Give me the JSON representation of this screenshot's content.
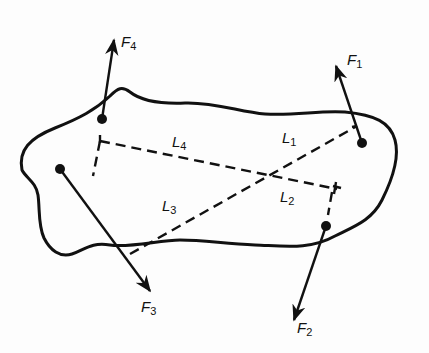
{
  "diagram": {
    "type": "free-body rigid body with four forces and moment arms",
    "forces": [
      {
        "id": "F1",
        "label": "F",
        "sub": "1",
        "point": [
          362,
          143
        ],
        "tip": [
          333,
          68
        ]
      },
      {
        "id": "F2",
        "label": "F",
        "sub": "2",
        "point": [
          326,
          226
        ],
        "tip": [
          294,
          320
        ]
      },
      {
        "id": "F3",
        "label": "F",
        "sub": "3",
        "point": [
          60,
          169
        ],
        "tip": [
          150,
          292
        ]
      },
      {
        "id": "F4",
        "label": "F",
        "sub": "4",
        "point": [
          102,
          119
        ],
        "tip": [
          112,
          38
        ]
      }
    ],
    "moment_arms": [
      {
        "id": "L1",
        "label": "L",
        "sub": "1"
      },
      {
        "id": "L2",
        "label": "L",
        "sub": "2"
      },
      {
        "id": "L3",
        "label": "L",
        "sub": "3"
      },
      {
        "id": "L4",
        "label": "L",
        "sub": "4"
      }
    ],
    "colors": {
      "ink": "#111111",
      "paper": "#fdfdfd"
    }
  }
}
